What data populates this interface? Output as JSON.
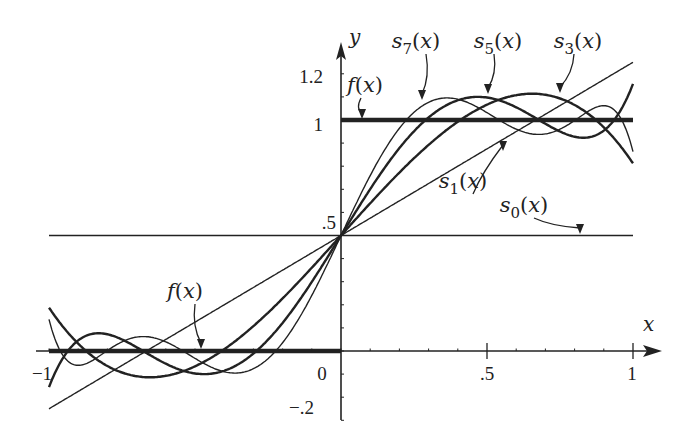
{
  "chart_data": {
    "type": "line",
    "title": "",
    "xlabel": "x",
    "ylabel": "y",
    "xlim": [
      -1,
      1
    ],
    "ylim": [
      -0.2,
      1.2
    ],
    "grid": false,
    "x_ticks": [
      {
        "value": -1,
        "label": "−1"
      },
      {
        "value": 0,
        "label": "0"
      },
      {
        "value": 0.5,
        "label": ".5"
      },
      {
        "value": 1,
        "label": "1"
      }
    ],
    "y_ticks": [
      {
        "value": 1.2,
        "label": "1.2"
      },
      {
        "value": 1,
        "label": "1"
      },
      {
        "value": 0.5,
        "label": ".5"
      },
      {
        "value": -0.2,
        "label": "−.2"
      }
    ],
    "series": [
      {
        "name": "f(x)",
        "description": "step function: 0 on [-1,0), 1 on (0,1]",
        "style": "thick"
      },
      {
        "name": "s0(x)",
        "legendre_coefficients": [
          0.5
        ],
        "style": "thin"
      },
      {
        "name": "s1(x)",
        "legendre_coefficients": [
          0.5,
          0.75
        ],
        "style": "thin"
      },
      {
        "name": "s3(x)",
        "legendre_coefficients": [
          0.5,
          0.75,
          0,
          -0.4375
        ],
        "style": "medium"
      },
      {
        "name": "s5(x)",
        "legendre_coefficients": [
          0.5,
          0.75,
          0,
          -0.4375,
          0,
          0.34375
        ],
        "style": "medium"
      },
      {
        "name": "s7(x)",
        "legendre_coefficients": [
          0.5,
          0.75,
          0,
          -0.4375,
          0,
          0.34375,
          0,
          -0.29296875
        ],
        "style": "thin"
      }
    ],
    "annotations": [
      {
        "text": "f(x)",
        "sub": "",
        "x": 185,
        "y": 298,
        "arrow_to": [
          201,
          349
        ]
      },
      {
        "text": "f(x)",
        "sub": "",
        "x": 365,
        "y": 92,
        "arrow_to": [
          362,
          119
        ]
      },
      {
        "text": "s",
        "sub": "7",
        "x": 416,
        "y": 48,
        "arrow_to": [
          422,
          100
        ]
      },
      {
        "text": "s",
        "sub": "5",
        "x": 498,
        "y": 48,
        "arrow_to": [
          488,
          94
        ]
      },
      {
        "text": "s",
        "sub": "3",
        "x": 578,
        "y": 48,
        "arrow_to": [
          560,
          93
        ]
      },
      {
        "text": "s",
        "sub": "1",
        "x": 463,
        "y": 188,
        "arrow_to": [
          503,
          151
        ]
      },
      {
        "text": "s",
        "sub": "0",
        "x": 524,
        "y": 212,
        "arrow_to": [
          580,
          234
        ]
      }
    ]
  }
}
